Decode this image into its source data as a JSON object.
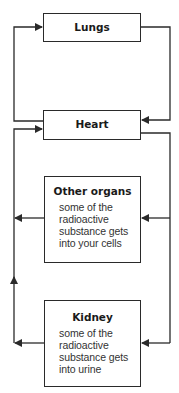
{
  "diagram": {
    "type": "flow",
    "nodes": [
      {
        "id": "lungs",
        "title": "Lungs"
      },
      {
        "id": "heart",
        "title": "Heart"
      },
      {
        "id": "other",
        "title": "Other organs",
        "desc_lines": [
          "some of the",
          "radioactive",
          "substance gets",
          "into your cells"
        ]
      },
      {
        "id": "kidney",
        "title": "Kidney",
        "desc_lines": [
          "some of the",
          "radioactive",
          "substance gets",
          "into urine"
        ]
      }
    ],
    "edges": [
      {
        "from": "heart",
        "to": "lungs"
      },
      {
        "from": "lungs",
        "to": "heart"
      },
      {
        "from": "heart",
        "to": "other"
      },
      {
        "from": "heart",
        "to": "kidney"
      },
      {
        "from": "other",
        "to": "heart"
      },
      {
        "from": "kidney",
        "to": "heart"
      }
    ],
    "line_color": "#2a2a2a"
  }
}
